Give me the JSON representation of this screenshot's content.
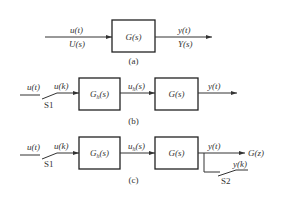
{
  "diagram_a": {
    "input_top": "u(t)",
    "input_bottom": "U(s)",
    "block": "G(s)",
    "output_top": "y(t)",
    "output_bottom": "Y(s)",
    "caption": "(a)"
  },
  "diagram_b": {
    "input": "u(t)",
    "sampled": "u(k)",
    "switch": "S1",
    "block1": "G_h(s)",
    "block1_main": "G",
    "block1_sub": "h",
    "block1_tail": "(s)",
    "mid_main": "u",
    "mid_sub": "h",
    "mid_tail": "(s)",
    "block2": "G(s)",
    "output": "y(t)",
    "caption": "(b)"
  },
  "diagram_c": {
    "input": "u(t)",
    "sampled": "u(k)",
    "switch1": "S1",
    "block1_main": "G",
    "block1_sub": "h",
    "block1_tail": "(s)",
    "mid_main": "u",
    "mid_sub": "h",
    "mid_tail": "(s)",
    "block2": "G(s)",
    "output": "y(t)",
    "output_target": "G(z)",
    "sampled_output": "y(k)",
    "switch2": "S2",
    "caption": "(c)"
  }
}
